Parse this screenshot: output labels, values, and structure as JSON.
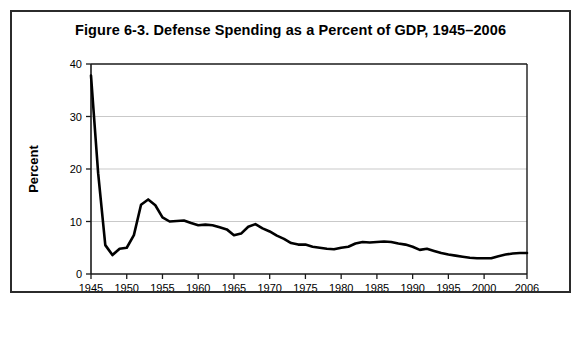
{
  "figure": {
    "title": "Figure 6-3. Defense Spending as a Percent of GDP, 1945–2006"
  },
  "chart_data": {
    "type": "line",
    "title": "Figure 6-3. Defense Spending as a Percent of GDP, 1945–2006",
    "xlabel": "Year",
    "ylabel": "Percent",
    "xlim": [
      1945,
      2006
    ],
    "ylim": [
      0,
      40
    ],
    "grid": "horizontal",
    "legend": "none",
    "yticks": [
      0,
      10,
      20,
      30,
      40
    ],
    "ytick_labels": [
      "0",
      "10",
      "20",
      "30",
      "40"
    ],
    "xticks": [
      1945,
      1950,
      1955,
      1960,
      1965,
      1970,
      1975,
      1980,
      1985,
      1990,
      1995,
      2000,
      2006
    ],
    "xtick_labels": [
      "1945",
      "1950",
      "1955",
      "1960",
      "1965",
      "1970",
      "1975",
      "1980",
      "1985",
      "1990",
      "1995",
      "2000",
      "2006"
    ],
    "series": [
      {
        "name": "Defense Spending as a Percent of GDP",
        "x": [
          1945,
          1946,
          1947,
          1948,
          1949,
          1950,
          1951,
          1952,
          1953,
          1954,
          1955,
          1956,
          1957,
          1958,
          1959,
          1960,
          1961,
          1962,
          1963,
          1964,
          1965,
          1966,
          1967,
          1968,
          1969,
          1970,
          1971,
          1972,
          1973,
          1974,
          1975,
          1976,
          1977,
          1978,
          1979,
          1980,
          1981,
          1982,
          1983,
          1984,
          1985,
          1986,
          1987,
          1988,
          1989,
          1990,
          1991,
          1992,
          1993,
          1994,
          1995,
          1996,
          1997,
          1998,
          1999,
          2000,
          2001,
          2002,
          2003,
          2004,
          2005,
          2006
        ],
        "values": [
          37.8,
          19.2,
          5.5,
          3.6,
          4.8,
          5.0,
          7.4,
          13.2,
          14.2,
          13.1,
          10.8,
          10.0,
          10.1,
          10.2,
          9.7,
          9.3,
          9.4,
          9.3,
          8.9,
          8.5,
          7.4,
          7.7,
          9.0,
          9.5,
          8.7,
          8.1,
          7.3,
          6.7,
          5.9,
          5.6,
          5.6,
          5.2,
          5.0,
          4.8,
          4.7,
          5.0,
          5.2,
          5.8,
          6.1,
          6.0,
          6.1,
          6.2,
          6.1,
          5.8,
          5.6,
          5.2,
          4.6,
          4.8,
          4.4,
          4.0,
          3.7,
          3.5,
          3.3,
          3.1,
          3.0,
          3.0,
          3.0,
          3.4,
          3.7,
          3.9,
          4.0,
          4.0
        ]
      }
    ]
  },
  "axes": {
    "y_title": "Percent",
    "x_title": "Year"
  }
}
